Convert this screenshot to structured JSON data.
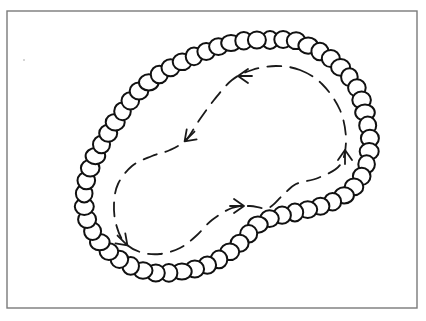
{
  "diagram": {
    "title": "Bead chain loop with circulating flow",
    "frame": {
      "x": 7,
      "y": 11,
      "width": 410,
      "height": 297,
      "stroke": "#7a7a7a"
    },
    "chain": {
      "shape": "kidney-shaped closed loop of beads",
      "bead_count_approx": 62,
      "bead_radius": 9,
      "stroke": "#111111",
      "path_points": [
        [
          270,
          40
        ],
        [
          293,
          40
        ],
        [
          313,
          48
        ],
        [
          330,
          58
        ],
        [
          345,
          72
        ],
        [
          357,
          88
        ],
        [
          363,
          105
        ],
        [
          367,
          122
        ],
        [
          370,
          140
        ],
        [
          368,
          158
        ],
        [
          363,
          174
        ],
        [
          353,
          188
        ],
        [
          340,
          198
        ],
        [
          324,
          205
        ],
        [
          306,
          210
        ],
        [
          288,
          214
        ],
        [
          271,
          218
        ],
        [
          256,
          226
        ],
        [
          245,
          238
        ],
        [
          232,
          250
        ],
        [
          218,
          260
        ],
        [
          202,
          267
        ],
        [
          185,
          271
        ],
        [
          167,
          273
        ],
        [
          149,
          272
        ],
        [
          131,
          266
        ],
        [
          116,
          257
        ],
        [
          103,
          246
        ],
        [
          93,
          232
        ],
        [
          86,
          216
        ],
        [
          84,
          199
        ],
        [
          86,
          182
        ],
        [
          91,
          166
        ],
        [
          98,
          151
        ],
        [
          106,
          137
        ],
        [
          114,
          124
        ],
        [
          122,
          112
        ],
        [
          131,
          100
        ],
        [
          141,
          89
        ],
        [
          152,
          80
        ],
        [
          163,
          72
        ],
        [
          176,
          65
        ],
        [
          190,
          58
        ],
        [
          205,
          52
        ],
        [
          220,
          46
        ],
        [
          236,
          42
        ],
        [
          252,
          40
        ]
      ]
    },
    "flow": {
      "style": "dashed",
      "direction": "counter-clockwise",
      "stroke": "#1a1a1a",
      "path_points": [
        [
          300,
          70
        ],
        [
          322,
          84
        ],
        [
          340,
          110
        ],
        [
          346,
          140
        ],
        [
          340,
          165
        ],
        [
          318,
          178
        ],
        [
          296,
          184
        ],
        [
          282,
          196
        ],
        [
          268,
          208
        ],
        [
          250,
          206
        ],
        [
          232,
          208
        ],
        [
          212,
          220
        ],
        [
          196,
          236
        ],
        [
          180,
          248
        ],
        [
          160,
          254
        ],
        [
          140,
          252
        ],
        [
          124,
          242
        ],
        [
          116,
          224
        ],
        [
          114,
          204
        ],
        [
          118,
          184
        ],
        [
          132,
          166
        ],
        [
          152,
          156
        ],
        [
          170,
          150
        ],
        [
          186,
          140
        ],
        [
          198,
          122
        ],
        [
          214,
          100
        ],
        [
          232,
          80
        ],
        [
          252,
          70
        ],
        [
          276,
          66
        ]
      ],
      "arrows": [
        {
          "name": "arrow-top",
          "x": 240,
          "y": 76,
          "direction": "left"
        },
        {
          "name": "arrow-upper-middle",
          "x": 186,
          "y": 140,
          "direction": "down-left"
        },
        {
          "name": "arrow-lower-left",
          "x": 126,
          "y": 244,
          "direction": "down-right"
        },
        {
          "name": "arrow-lower-middle",
          "x": 242,
          "y": 206,
          "direction": "right"
        },
        {
          "name": "arrow-right",
          "x": 345,
          "y": 152,
          "direction": "up"
        }
      ]
    }
  }
}
